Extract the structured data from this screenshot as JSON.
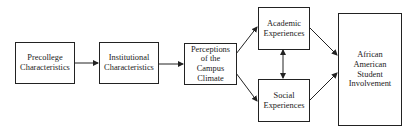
{
  "diagram": {
    "nodes": [
      {
        "id": "precollege",
        "label": "Precollege\nCharacteristics"
      },
      {
        "id": "institutional",
        "label": "Institutional\nCharacteristics"
      },
      {
        "id": "perceptions",
        "label": "Perceptions\nof the\nCampus\nClimate"
      },
      {
        "id": "academic",
        "label": "Academic\nExperiences"
      },
      {
        "id": "social",
        "label": "Social\nExperiences"
      },
      {
        "id": "involvement",
        "label": "African\nAmerican\nStudent\nInvolvement"
      }
    ],
    "edges": [
      {
        "from": "precollege",
        "to": "institutional",
        "type": "directed"
      },
      {
        "from": "institutional",
        "to": "perceptions",
        "type": "directed"
      },
      {
        "from": "perceptions",
        "to": "academic",
        "type": "directed"
      },
      {
        "from": "perceptions",
        "to": "social",
        "type": "directed"
      },
      {
        "from": "academic",
        "to": "social",
        "type": "bidirectional"
      },
      {
        "from": "academic",
        "to": "involvement",
        "type": "directed"
      },
      {
        "from": "social",
        "to": "involvement",
        "type": "directed"
      }
    ]
  }
}
